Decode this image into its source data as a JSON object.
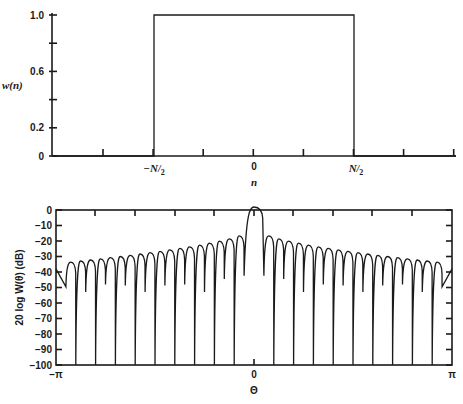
{
  "chart_data": [
    {
      "type": "line",
      "title": "Rectangular window w(n)",
      "xlabel": "n",
      "ylabel": "w(n)",
      "ylim": [
        0,
        1.0
      ],
      "y_ticks": [
        0,
        0.2,
        0.4,
        0.6,
        0.8,
        1.0
      ],
      "y_tick_labels": [
        "0",
        "0.2",
        "",
        "0.6",
        "",
        "1.0"
      ],
      "x_tick_labels": [
        {
          "pos": -0.5,
          "label": "-N/2"
        },
        {
          "pos": 0,
          "label": "0"
        },
        {
          "pos": 0.5,
          "label": "N/2"
        }
      ],
      "x": [
        -1.0,
        -0.5,
        -0.5,
        0.5,
        0.5,
        1.0
      ],
      "y": [
        0,
        0,
        1.0,
        1.0,
        0,
        0
      ],
      "grid": false
    },
    {
      "type": "line",
      "title": "Window spectrum magnitude",
      "xlabel": "Θ",
      "ylabel": "20 log W(θ) (dB)",
      "xlim": [
        -3.14159,
        3.14159
      ],
      "ylim": [
        -100,
        0
      ],
      "y_ticks": [
        0,
        -10,
        -20,
        -30,
        -40,
        -50,
        -60,
        -70,
        -80,
        -90,
        -100
      ],
      "y_tick_labels": [
        "0",
        "−10",
        "−20",
        "−30",
        "−40",
        "−50",
        "−60",
        "−70",
        "−80",
        "−90",
        "−100"
      ],
      "x_tick_labels": [
        {
          "pos": -3.14159,
          "label": "−π"
        },
        {
          "pos": 0,
          "label": "0"
        },
        {
          "pos": 3.14159,
          "label": "π"
        }
      ],
      "main_lobe_peak_db": 0,
      "first_sidelobe_db": -13,
      "far_sidelobe_db": -36,
      "null_depth_db": -100,
      "alternate_null_depth_db": -50,
      "nulls_per_side": 19,
      "grid": false
    }
  ],
  "labels": {
    "top_ylabel": "w(n)",
    "top_xlabel": "n",
    "top_yticks": [
      "1.0",
      "0.6",
      "0.2",
      "0"
    ],
    "top_xticks": [
      "−N/2",
      "0",
      "N/2"
    ],
    "bottom_ylabel": "20 log W(θ) (dB)",
    "bottom_xlabel": "Θ",
    "bottom_xticks": [
      "−π",
      "0",
      "π"
    ]
  }
}
